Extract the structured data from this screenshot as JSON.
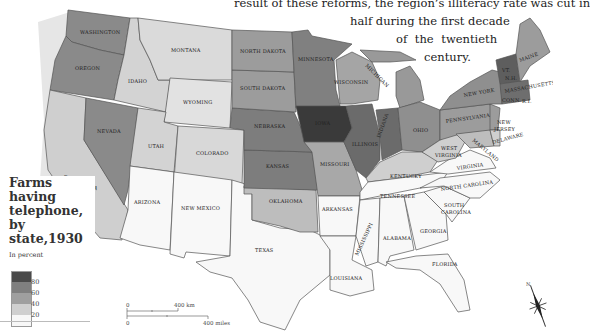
{
  "caption": {
    "lines": [
      "result of these reforms, the region’s illiteracy rate was cut in",
      "half during the first decade",
      "of  the  twentieth",
      "century."
    ]
  },
  "legend": {
    "title_lines": [
      "Farms",
      "having",
      "telephone,",
      "by state,1930"
    ],
    "unit": "In percent",
    "ticks": [
      "80",
      "60",
      "40",
      "20"
    ],
    "colors": [
      "#4a4a4a",
      "#7f7f7f",
      "#9f9f9f",
      "#cfcfcf",
      "#f7f7f7"
    ]
  },
  "scale_bar": {
    "km_zero": "0",
    "km_label": "400 km",
    "mi_zero": "0",
    "mi_label": "400 miles"
  },
  "compass": {
    "label": "N"
  },
  "states": {
    "washington": "WASHINGTON",
    "oregon": "OREGON",
    "california": "CALIFORNIA",
    "nevada": "NEVADA",
    "idaho": "IDAHO",
    "montana": "MONTANA",
    "wyoming": "WYOMING",
    "utah": "UTAH",
    "colorado": "COLORADO",
    "arizona": "ARIZONA",
    "new_mexico": "NEW MEXICO",
    "texas": "TEXAS",
    "oklahoma": "OKLAHOMA",
    "kansas": "KANSAS",
    "nebraska": "NEBRASKA",
    "south_dakota": "SOUTH DAKOTA",
    "north_dakota": "NORTH DAKOTA",
    "minnesota": "MINNESOTA",
    "iowa": "IOWA",
    "missouri": "MISSOURI",
    "arkansas": "ARKANSAS",
    "louisiana": "LOUISIANA",
    "wisconsin": "WISCONSIN",
    "illinois": "ILLINOIS",
    "michigan": "MICHIGAN",
    "indiana": "INDIANA",
    "ohio": "OHIO",
    "kentucky": "KENTUCKY",
    "tennessee": "TENNESSEE",
    "mississippi": "MISSISSIPPI",
    "alabama": "ALABAMA",
    "georgia": "GEORGIA",
    "florida": "FLORIDA",
    "south_carolina_1": "SOUTH",
    "south_carolina_2": "CAROLINA",
    "north_carolina": "NORTH CAROLINA",
    "virginia": "VIRGINIA",
    "west_virginia_1": "WEST",
    "west_virginia_2": "VIRGINIA",
    "pennsylvania": "PENNSYLVANIA",
    "new_york": "NEW YORK",
    "maryland": "MARYLAND",
    "delaware": "DELAWARE",
    "new_jersey_1": "NEW",
    "new_jersey_2": "JERSEY",
    "maine": "MAINE",
    "new_hampshire": "N.H.",
    "vermont": "VT.",
    "massachusetts": "MASSACHUSETTS",
    "connecticut": "CONN.",
    "rhode_island": "R.I."
  }
}
